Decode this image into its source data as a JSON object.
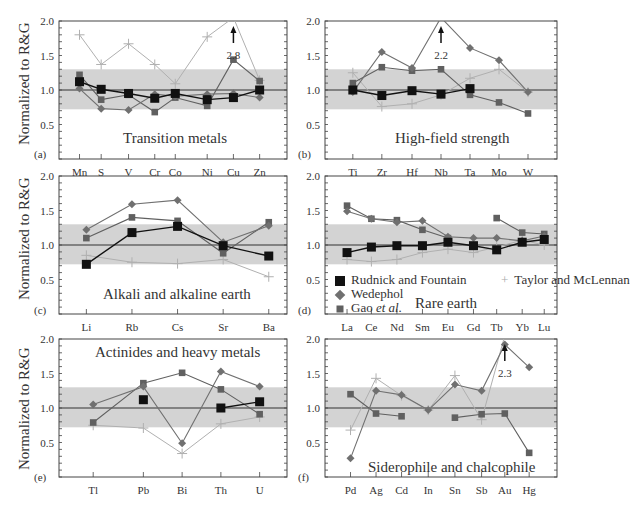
{
  "chart_data": [
    {
      "panel": "(a)",
      "type": "line",
      "title": "Transition metals",
      "ylabel": "Normalized to R&G",
      "ylim": [
        0,
        2.0
      ],
      "yticks": [
        0.5,
        1.0,
        1.5,
        2.0
      ],
      "band": [
        0.72,
        1.3
      ],
      "reference_line": 1.0,
      "categories": [
        "Mn",
        "S",
        "V",
        "Cr",
        "Co",
        "Ni",
        "Cu",
        "Zn"
      ],
      "series": [
        {
          "name": "Rudnick and Fountain",
          "values": [
            1.12,
            1.01,
            0.95,
            0.88,
            0.95,
            0.86,
            0.89,
            1.0
          ]
        },
        {
          "name": "Wedephol",
          "values": [
            1.02,
            0.73,
            0.71,
            0.94,
            0.91,
            0.94,
            0.95,
            0.89
          ]
        },
        {
          "name": "Gao et al.",
          "values": [
            1.22,
            0.86,
            0.93,
            0.68,
            0.89,
            0.77,
            1.44,
            1.13
          ]
        },
        {
          "name": "Taylor and McLennan",
          "values": [
            1.8,
            1.37,
            1.67,
            1.37,
            1.09,
            1.77,
            2.8,
            1.14
          ]
        }
      ],
      "annotations": [
        {
          "text": "2.8",
          "category": "Cu",
          "arrow": "up"
        }
      ]
    },
    {
      "panel": "(b)",
      "type": "line",
      "title": "High-field strength",
      "ylim": [
        0,
        2.0
      ],
      "yticks": [
        0.5,
        1.0,
        1.5,
        2.0
      ],
      "band": [
        0.72,
        1.3
      ],
      "reference_line": 1.0,
      "categories": [
        "Ti",
        "Zr",
        "Hf",
        "Nb",
        "Ta",
        "Mo",
        "W"
      ],
      "series": [
        {
          "name": "Rudnick and Fountain",
          "values": [
            1.0,
            0.92,
            0.99,
            0.94,
            1.02,
            null,
            null
          ]
        },
        {
          "name": "Wedephol",
          "values": [
            0.97,
            1.55,
            1.32,
            2.2,
            1.61,
            1.43,
            0.97
          ]
        },
        {
          "name": "Gao et al.",
          "values": [
            1.1,
            1.33,
            1.28,
            1.3,
            0.93,
            0.82,
            0.66
          ]
        },
        {
          "name": "Taylor and McLennan",
          "values": [
            1.25,
            0.76,
            0.8,
            0.93,
            1.17,
            1.3,
            0.97
          ]
        }
      ],
      "annotations": [
        {
          "text": "2.2",
          "category": "Nb",
          "arrow": "up"
        }
      ]
    },
    {
      "panel": "(c)",
      "type": "line",
      "title": "Alkali and alkaline earth",
      "ylabel": "Normalized to R&G",
      "ylim": [
        0,
        2.0
      ],
      "yticks": [
        0.5,
        1.0,
        1.5,
        2.0
      ],
      "band": [
        0.72,
        1.3
      ],
      "reference_line": 1.0,
      "categories": [
        "Li",
        "Rb",
        "Cs",
        "Sr",
        "Ba"
      ],
      "series": [
        {
          "name": "Rudnick and Fountain",
          "values": [
            0.72,
            1.18,
            1.27,
            0.99,
            0.84
          ]
        },
        {
          "name": "Wedephol",
          "values": [
            1.22,
            1.59,
            1.65,
            1.04,
            1.28
          ]
        },
        {
          "name": "Gao et al.",
          "values": [
            1.1,
            1.4,
            1.35,
            0.88,
            1.33
          ]
        },
        {
          "name": "Taylor and McLennan",
          "values": [
            0.85,
            0.75,
            0.73,
            0.79,
            0.54
          ]
        }
      ]
    },
    {
      "panel": "(d)",
      "type": "line",
      "title": "Rare earth",
      "ylim": [
        0,
        2.0
      ],
      "yticks": [
        0.5,
        1.0,
        1.5,
        2.0
      ],
      "band": [
        0.72,
        1.3
      ],
      "reference_line": 1.0,
      "categories": [
        "La",
        "Ce",
        "Nd",
        "Sm",
        "Eu",
        "Gd",
        "Tb",
        "Yb",
        "Lu"
      ],
      "series": [
        {
          "name": "Rudnick and Fountain",
          "values": [
            0.89,
            0.97,
            0.99,
            0.99,
            1.04,
            0.99,
            0.93,
            1.04,
            1.08
          ]
        },
        {
          "name": "Wedephol",
          "values": [
            1.49,
            1.38,
            1.33,
            1.35,
            1.12,
            1.1,
            1.1,
            1.06,
            1.13
          ]
        },
        {
          "name": "Gao et al.",
          "values": [
            1.57,
            1.38,
            1.36,
            1.22,
            1.1,
            null,
            1.39,
            1.18,
            1.16
          ]
        },
        {
          "name": "Taylor and McLennan",
          "values": [
            0.79,
            0.76,
            0.79,
            0.89,
            0.94,
            0.89,
            0.97,
            1.07,
            1.0
          ]
        }
      ],
      "legend": {
        "position": "lower-left inside",
        "entries": [
          "Rudnick and Fountain",
          "Wedephol",
          "Gao et al.",
          "Taylor and McLennan"
        ]
      }
    },
    {
      "panel": "(e)",
      "type": "line",
      "title": "Actinides and heavy metals",
      "ylabel": "Normalized to R&G",
      "ylim": [
        0,
        2.0
      ],
      "yticks": [
        0.5,
        1.0,
        1.5,
        2.0
      ],
      "band": [
        0.72,
        1.3
      ],
      "reference_line": 1.0,
      "categories": [
        "Tl",
        "Pb",
        "Bi",
        "Th",
        "U"
      ],
      "series": [
        {
          "name": "Rudnick and Fountain",
          "values": [
            null,
            1.12,
            null,
            1.0,
            1.09
          ]
        },
        {
          "name": "Wedephol",
          "values": [
            1.05,
            1.31,
            0.49,
            1.53,
            1.31
          ]
        },
        {
          "name": "Gao et al.",
          "values": [
            0.79,
            1.36,
            1.51,
            1.27,
            0.91
          ]
        },
        {
          "name": "Taylor and McLennan",
          "values": [
            0.75,
            0.71,
            0.34,
            0.77,
            0.87
          ]
        }
      ]
    },
    {
      "panel": "(f)",
      "type": "line",
      "title": "Siderophile and chalcophile",
      "ylim": [
        0,
        2.0
      ],
      "yticks": [
        0.5,
        1.0,
        1.5,
        2.0
      ],
      "band": [
        0.72,
        1.3
      ],
      "reference_line": 1.0,
      "categories": [
        "Pd",
        "Ag",
        "Cd",
        "In",
        "Sn",
        "Sb",
        "Au",
        "Hg"
      ],
      "series": [
        {
          "name": "Wedephol",
          "values": [
            0.27,
            1.25,
            1.19,
            0.97,
            1.34,
            1.25,
            1.92,
            1.59
          ]
        },
        {
          "name": "Gao et al.",
          "values": [
            1.2,
            0.92,
            0.88,
            null,
            0.86,
            0.91,
            0.92,
            0.35
          ]
        },
        {
          "name": "Taylor and McLennan",
          "values": [
            0.68,
            1.43,
            1.18,
            0.97,
            1.47,
            0.83,
            2.3,
            null
          ]
        }
      ],
      "annotations": [
        {
          "text": "2.3",
          "category": "Au",
          "arrow": "up"
        }
      ]
    }
  ],
  "labels": {
    "ylabel": "Normalized to R&G",
    "panels": [
      "(a)",
      "(b)",
      "(c)",
      "(d)",
      "(e)",
      "(f)"
    ],
    "titles": [
      "Transition metals",
      "High-field strength",
      "Alkali and alkaline earth",
      "Rare earth",
      "Actinides and heavy metals",
      "Siderophile and chalcophile"
    ],
    "legend": [
      "Rudnick and Fountain",
      "Wedephol",
      "Gao ",
      "et al.",
      "Taylor and McLennan"
    ]
  },
  "colors": {
    "rudnick": "#111111",
    "wedepohl": "#707070",
    "gao": "#606060",
    "taylor": "#b0b0b0",
    "band": "#d3d3d3",
    "axis": "#333333"
  }
}
